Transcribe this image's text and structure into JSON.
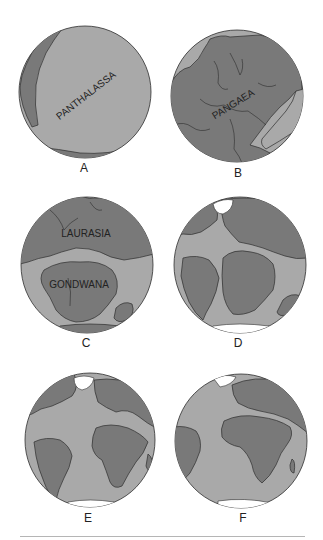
{
  "colors": {
    "ocean": "#a9a9a9",
    "land": "#797979",
    "coast": "#2e2e2e",
    "ice": "#ffffff",
    "rule": "#b5b5b5"
  },
  "panels": [
    {
      "id": "A",
      "label": "A",
      "map_labels": [
        "PANTHALASSA"
      ]
    },
    {
      "id": "B",
      "label": "B",
      "map_labels": [
        "PANGAEA"
      ]
    },
    {
      "id": "C",
      "label": "C",
      "map_labels": [
        "LAURASIA",
        "GONDWANA"
      ]
    },
    {
      "id": "D",
      "label": "D",
      "map_labels": []
    },
    {
      "id": "E",
      "label": "E",
      "map_labels": []
    },
    {
      "id": "F",
      "label": "F",
      "map_labels": []
    }
  ]
}
